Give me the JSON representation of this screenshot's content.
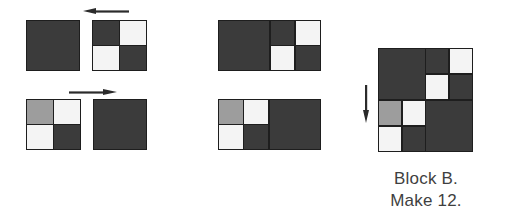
{
  "figure": {
    "kind": "quilt-block-assembly-diagram",
    "caption_line1": "Block B.",
    "caption_line2": "Make 12."
  },
  "colors": {
    "dark": "#3b3b3b",
    "medium_gray": "#9d9d9d",
    "white": "#f4f4f4",
    "seam": "#1e1e1e",
    "arrow": "#2b2b2b",
    "text": "#3f3f3f",
    "background": "#ffffff"
  },
  "rows": [
    {
      "id": "row-1",
      "arrow": {
        "name": "arrow-left",
        "direction": "left",
        "glyph": "left-pointing-arrow"
      },
      "pieces": [
        {
          "id": "row1-solid-square",
          "type": "solid",
          "color_key": "dark",
          "label": "solid dark square"
        },
        {
          "id": "row1-four-patch",
          "type": "four-patch",
          "patches": [
            "dark",
            "white",
            "white",
            "dark"
          ],
          "label": "four-patch unit"
        }
      ],
      "result": {
        "id": "row1-joined",
        "type": "joined-horizontal",
        "label": "solid square joined to four-patch",
        "parts": [
          {
            "type": "solid",
            "color_key": "dark"
          },
          {
            "type": "four-patch",
            "patches": [
              "dark",
              "white",
              "white",
              "dark"
            ]
          }
        ]
      }
    },
    {
      "id": "row-2",
      "arrow": {
        "name": "arrow-right",
        "direction": "right",
        "glyph": "right-pointing-arrow"
      },
      "pieces": [
        {
          "id": "row2-four-patch",
          "type": "four-patch",
          "patches": [
            "medium_gray",
            "white",
            "white",
            "dark"
          ],
          "label": "four-patch unit with gray corner"
        },
        {
          "id": "row2-solid-square",
          "type": "solid",
          "color_key": "dark",
          "label": "solid dark square"
        }
      ],
      "result": {
        "id": "row2-joined",
        "type": "joined-horizontal",
        "label": "four-patch joined to solid square",
        "parts": [
          {
            "type": "four-patch",
            "patches": [
              "medium_gray",
              "white",
              "white",
              "dark"
            ]
          },
          {
            "type": "solid",
            "color_key": "dark"
          }
        ]
      }
    }
  ],
  "final_block": {
    "id": "block-b",
    "label": "Block B finished layout",
    "arrow": {
      "name": "arrow-down",
      "direction": "down",
      "glyph": "down-pointing-arrow"
    },
    "quadrants": [
      {
        "position": "top-left",
        "type": "solid",
        "color_key": "dark"
      },
      {
        "position": "top-right",
        "type": "four-patch",
        "patches": [
          "dark",
          "white",
          "white",
          "dark"
        ]
      },
      {
        "position": "bottom-left",
        "type": "four-patch",
        "patches": [
          "medium_gray",
          "white",
          "white",
          "dark"
        ]
      },
      {
        "position": "bottom-right",
        "type": "solid",
        "color_key": "dark"
      }
    ]
  }
}
